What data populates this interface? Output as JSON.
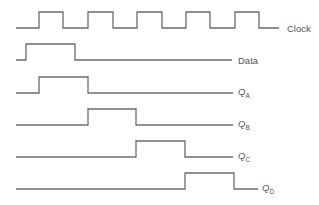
{
  "diagram": {
    "type": "timing-diagram",
    "signals": [
      {
        "name": "Clock",
        "label": "Clock",
        "label_main": "Clock",
        "label_sub": "",
        "label_pos": [
          287,
          24
        ],
        "points": "16,28 39,28 39,12 63,12 63,28 88,28 88,12 113,12 113,28 137,28 137,12 162,12 162,28 186,28 186,12 210,12 210,28 235,28 235,12 259,12 259,28 279,28"
      },
      {
        "name": "Data",
        "label": "Data",
        "label_main": "Data",
        "label_sub": "",
        "label_pos": [
          238,
          56
        ],
        "points": "16,60 26,60 26,44 75,44 75,60 232,60"
      },
      {
        "name": "QA",
        "label": "QA",
        "label_main": "Q",
        "label_sub": "A",
        "label_pos": [
          238,
          88
        ],
        "points": "16,93 39,93 39,77 88,77 88,93 233,93"
      },
      {
        "name": "QB",
        "label": "QB",
        "label_main": "Q",
        "label_sub": "B",
        "label_pos": [
          238,
          120
        ],
        "points": "16,125 88,125 88,109 136,109 136,125 233,125"
      },
      {
        "name": "QC",
        "label": "QC",
        "label_main": "Q",
        "label_sub": "C",
        "label_pos": [
          238,
          152
        ],
        "points": "16,157 136,157 136,141 185,141 185,157 233,157"
      },
      {
        "name": "QD",
        "label": "QD",
        "label_main": "Q",
        "label_sub": "D",
        "label_pos": [
          262,
          184
        ],
        "points": "16,189 185,189 185,173 234,173 234,189 258,189"
      }
    ]
  }
}
